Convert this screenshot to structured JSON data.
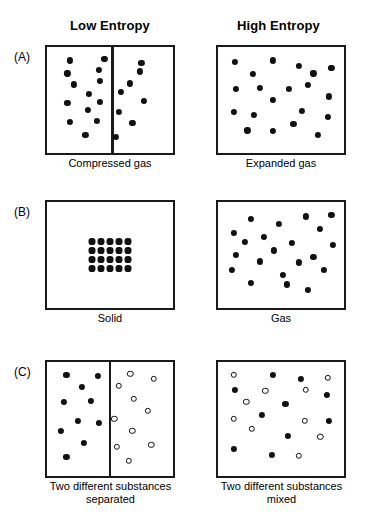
{
  "figure": {
    "column_headers": [
      {
        "label": "Low Entropy"
      },
      {
        "label": "High Entropy"
      }
    ],
    "rows": [
      {
        "panel_label": "(A)",
        "left": {
          "caption": "Compressed gas",
          "divided": true,
          "divider_fraction": 0.52
        },
        "right": {
          "caption": "Expanded gas",
          "divided": false
        }
      },
      {
        "panel_label": "(B)",
        "left": {
          "caption": "Solid",
          "divided": false
        },
        "right": {
          "caption": "Gas",
          "divided": false
        }
      },
      {
        "panel_label": "(C)",
        "left": {
          "caption": "Two different substances\nseparated",
          "divided": true,
          "divider_fraction": 0.5
        },
        "right": {
          "caption": "Two different substances\nmixed",
          "divided": false
        }
      }
    ],
    "colors": {
      "ink": "#111111",
      "box_border": "#1a1a1a",
      "background": "#ffffff"
    },
    "particle_styles": {
      "filled": "filled-circle",
      "open": "open-circle"
    }
  },
  "chart_data": {
    "type": "scatter",
    "panels": [
      {
        "id": "A-left",
        "row": "(A)",
        "column": "Low Entropy",
        "caption": "Compressed gas",
        "divider_x": 0.52,
        "particle_count": 20,
        "filled_points": [
          [
            0.14,
            0.07
          ],
          [
            0.45,
            0.05
          ],
          [
            0.78,
            0.1
          ],
          [
            0.12,
            0.21
          ],
          [
            0.4,
            0.17
          ],
          [
            0.77,
            0.19
          ],
          [
            0.41,
            0.29
          ],
          [
            0.18,
            0.33
          ],
          [
            0.68,
            0.32
          ],
          [
            0.31,
            0.43
          ],
          [
            0.6,
            0.41
          ],
          [
            0.12,
            0.53
          ],
          [
            0.41,
            0.52
          ],
          [
            0.8,
            0.51
          ],
          [
            0.3,
            0.61
          ],
          [
            0.58,
            0.63
          ],
          [
            0.14,
            0.74
          ],
          [
            0.38,
            0.73
          ],
          [
            0.7,
            0.75
          ],
          [
            0.28,
            0.88
          ],
          [
            0.55,
            0.9
          ]
        ],
        "open_points": []
      },
      {
        "id": "A-right",
        "row": "(A)",
        "column": "High Entropy",
        "caption": "Expanded gas",
        "divider_x": null,
        "particle_count": 18,
        "filled_points": [
          [
            0.09,
            0.09
          ],
          [
            0.43,
            0.07
          ],
          [
            0.66,
            0.13
          ],
          [
            0.95,
            0.15
          ],
          [
            0.25,
            0.22
          ],
          [
            0.79,
            0.21
          ],
          [
            0.1,
            0.38
          ],
          [
            0.31,
            0.37
          ],
          [
            0.57,
            0.38
          ],
          [
            0.74,
            0.34
          ],
          [
            0.93,
            0.46
          ],
          [
            0.43,
            0.5
          ],
          [
            0.08,
            0.63
          ],
          [
            0.26,
            0.66
          ],
          [
            0.69,
            0.62
          ],
          [
            0.92,
            0.68
          ],
          [
            0.2,
            0.83
          ],
          [
            0.43,
            0.84
          ],
          [
            0.61,
            0.76
          ],
          [
            0.83,
            0.88
          ]
        ],
        "open_points": []
      },
      {
        "id": "B-left",
        "row": "(B)",
        "column": "Low Entropy",
        "caption": "Solid",
        "divider_x": null,
        "lattice": {
          "columns": 5,
          "rows": 4,
          "center": [
            0.5,
            0.5
          ]
        },
        "particle_count": 20,
        "filled_points": [],
        "open_points": []
      },
      {
        "id": "B-right",
        "row": "(B)",
        "column": "High Entropy",
        "caption": "Gas",
        "divider_x": null,
        "particle_count": 19,
        "filled_points": [
          [
            0.23,
            0.11
          ],
          [
            0.48,
            0.16
          ],
          [
            0.72,
            0.08
          ],
          [
            0.95,
            0.06
          ],
          [
            0.08,
            0.26
          ],
          [
            0.35,
            0.3
          ],
          [
            0.85,
            0.22
          ],
          [
            0.18,
            0.36
          ],
          [
            0.6,
            0.37
          ],
          [
            0.96,
            0.39
          ],
          [
            0.1,
            0.5
          ],
          [
            0.44,
            0.45
          ],
          [
            0.31,
            0.57
          ],
          [
            0.79,
            0.52
          ],
          [
            0.66,
            0.58
          ],
          [
            0.06,
            0.66
          ],
          [
            0.88,
            0.66
          ],
          [
            0.52,
            0.72
          ],
          [
            0.23,
            0.8
          ],
          [
            0.55,
            0.82
          ],
          [
            0.74,
            0.88
          ]
        ],
        "open_points": []
      },
      {
        "id": "C-left",
        "row": "(C)",
        "column": "Low Entropy",
        "caption": "Two different substances separated",
        "divider_x": 0.5,
        "particle_count": 20,
        "filled_points": [
          [
            0.11,
            0.06
          ],
          [
            0.39,
            0.07
          ],
          [
            0.25,
            0.18
          ],
          [
            0.09,
            0.33
          ],
          [
            0.33,
            0.32
          ],
          [
            0.21,
            0.52
          ],
          [
            0.4,
            0.54
          ],
          [
            0.06,
            0.62
          ],
          [
            0.27,
            0.74
          ],
          [
            0.11,
            0.88
          ]
        ],
        "open_points": [
          [
            0.68,
            0.05
          ],
          [
            0.89,
            0.1
          ],
          [
            0.58,
            0.17
          ],
          [
            0.71,
            0.3
          ],
          [
            0.84,
            0.42
          ],
          [
            0.54,
            0.5
          ],
          [
            0.7,
            0.62
          ],
          [
            0.56,
            0.78
          ],
          [
            0.87,
            0.76
          ],
          [
            0.67,
            0.92
          ]
        ]
      },
      {
        "id": "C-right",
        "row": "(C)",
        "column": "High Entropy",
        "caption": "Two different substances mixed",
        "divider_x": null,
        "particle_count": 21,
        "filled_points": [
          [
            0.43,
            0.06
          ],
          [
            0.68,
            0.1
          ],
          [
            0.09,
            0.21
          ],
          [
            0.91,
            0.26
          ],
          [
            0.54,
            0.35
          ],
          [
            0.33,
            0.46
          ],
          [
            0.93,
            0.52
          ],
          [
            0.56,
            0.67
          ],
          [
            0.08,
            0.8
          ],
          [
            0.42,
            0.86
          ]
        ],
        "open_points": [
          [
            0.08,
            0.06
          ],
          [
            0.92,
            0.09
          ],
          [
            0.36,
            0.22
          ],
          [
            0.72,
            0.21
          ],
          [
            0.19,
            0.33
          ],
          [
            0.08,
            0.5
          ],
          [
            0.71,
            0.52
          ],
          [
            0.24,
            0.6
          ],
          [
            0.85,
            0.68
          ],
          [
            0.66,
            0.87
          ]
        ]
      }
    ],
    "legend": [
      {
        "symbol": "filled-circle",
        "meaning": "substance 1 particle"
      },
      {
        "symbol": "open-circle",
        "meaning": "substance 2 particle"
      }
    ]
  }
}
